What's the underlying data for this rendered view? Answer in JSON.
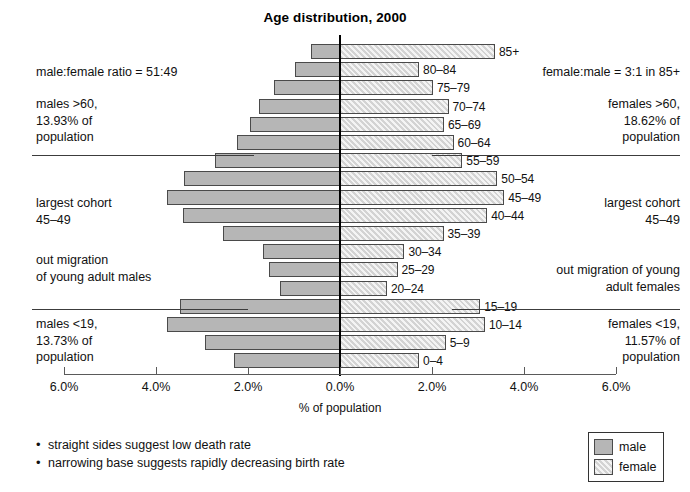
{
  "chart_data": {
    "type": "bar",
    "subtype": "population-pyramid",
    "title": "Age distribution, 2000",
    "xlabel": "% of population",
    "ylabel": "",
    "xlim": [
      -6.0,
      6.0
    ],
    "xticks": [
      "6.0%",
      "4.0%",
      "2.0%",
      "0.0%",
      "2.0%",
      "4.0%",
      "6.0%"
    ],
    "xtick_values": [
      -6.0,
      -4.0,
      -2.0,
      0.0,
      2.0,
      4.0,
      6.0
    ],
    "grid": false,
    "legend_position": "bottom-right",
    "categories": [
      "0–4",
      "5–9",
      "10–14",
      "15–19",
      "20–24",
      "25–29",
      "30–34",
      "35–39",
      "40–44",
      "45–49",
      "50–54",
      "55–59",
      "60–64",
      "65–69",
      "70–74",
      "75–79",
      "80–84",
      "85+"
    ],
    "series": [
      {
        "name": "male",
        "color": "#b6b6b6",
        "values": [
          2.3,
          2.93,
          3.76,
          3.48,
          1.31,
          1.54,
          1.68,
          2.54,
          3.41,
          3.76,
          3.4,
          2.72,
          2.23,
          1.95,
          1.76,
          1.43,
          0.98,
          0.62
        ]
      },
      {
        "name": "female",
        "color": "#d3d3d3",
        "values": [
          1.72,
          2.3,
          3.15,
          3.05,
          1.02,
          1.25,
          1.4,
          2.25,
          3.2,
          3.57,
          3.42,
          2.66,
          2.47,
          2.26,
          2.36,
          2.02,
          1.72,
          3.37
        ]
      }
    ]
  },
  "legend": {
    "items": [
      {
        "label": "male",
        "swatch": "male"
      },
      {
        "label": "female",
        "swatch": "female"
      }
    ]
  },
  "annotations": {
    "left": [
      {
        "id": "male-female-ratio",
        "text": "male:female ratio = 51:49"
      },
      {
        "id": "males-over-60",
        "text": "males >60,\n13.93% of\npopulation"
      },
      {
        "id": "largest-cohort-male",
        "text": "largest cohort\n45–49"
      },
      {
        "id": "out-migration-male",
        "text": "out migration\nof young adult males"
      },
      {
        "id": "males-under-19",
        "text": "males <19,\n13.73% of\npopulation"
      }
    ],
    "right": [
      {
        "id": "female-male-ratio",
        "text": "female:male = 3:1 in 85+"
      },
      {
        "id": "females-over-60",
        "text": "females >60,\n18.62% of\npopulation"
      },
      {
        "id": "largest-cohort-female",
        "text": "largest cohort\n45–49"
      },
      {
        "id": "out-migration-female",
        "text": "out migration of young\nadult females"
      },
      {
        "id": "females-under-19",
        "text": "females <19,\n11.57% of\npopulation"
      }
    ]
  },
  "notes": [
    {
      "bullet": "•",
      "text": "straight sides suggest low death rate"
    },
    {
      "bullet": "•",
      "text": "narrowing base suggests rapidly decreasing birth rate"
    }
  ]
}
